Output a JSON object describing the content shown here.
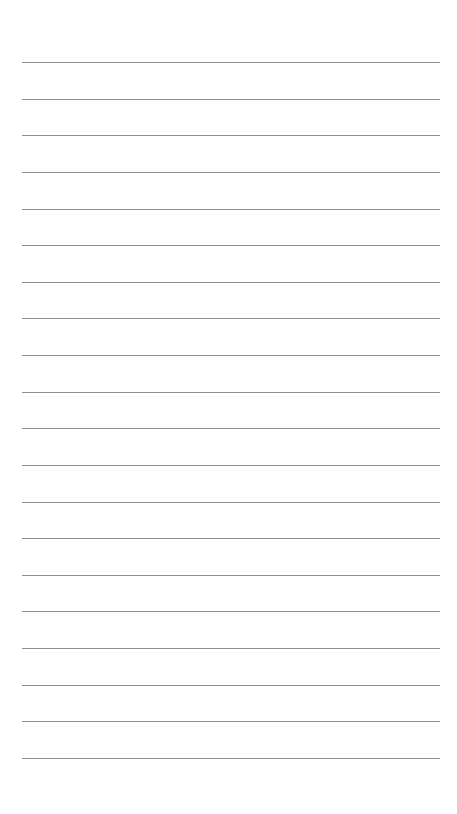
{
  "page": {
    "type": "lined-paper",
    "background_color": "#ffffff",
    "line_color": "#8e8e8e",
    "line_count": 20,
    "first_line_y": 62,
    "line_spacing": 36.63,
    "line_left": 22,
    "line_right": 440,
    "lines": [
      "",
      "",
      "",
      "",
      "",
      "",
      "",
      "",
      "",
      "",
      "",
      "",
      "",
      "",
      "",
      "",
      "",
      "",
      "",
      ""
    ]
  }
}
